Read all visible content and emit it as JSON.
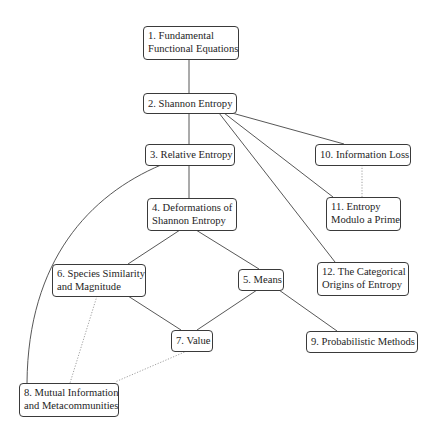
{
  "diagram": {
    "nodes": [
      {
        "id": "1",
        "lines": [
          "1. Fundamental",
          "Functional Equations"
        ]
      },
      {
        "id": "2",
        "lines": [
          "2. Shannon Entropy"
        ]
      },
      {
        "id": "3",
        "lines": [
          "3. Relative Entropy"
        ]
      },
      {
        "id": "4",
        "lines": [
          "4. Deformations of",
          "Shannon Entropy"
        ]
      },
      {
        "id": "5",
        "lines": [
          "5. Means"
        ]
      },
      {
        "id": "6",
        "lines": [
          "6. Species Similarity",
          "and Magnitude"
        ]
      },
      {
        "id": "7",
        "lines": [
          "7. Value"
        ]
      },
      {
        "id": "8",
        "lines": [
          "8. Mutual Information",
          "and Metacommunities"
        ]
      },
      {
        "id": "9",
        "lines": [
          "9. Probabilistic Methods"
        ]
      },
      {
        "id": "10",
        "lines": [
          "10. Information Loss"
        ]
      },
      {
        "id": "11",
        "lines": [
          "11. Entropy",
          "Modulo a Prime"
        ]
      },
      {
        "id": "12",
        "lines": [
          "12. The Categorical",
          "Origins of Entropy"
        ]
      }
    ],
    "edges": [
      {
        "from": "1",
        "to": "2",
        "style": "solid"
      },
      {
        "from": "2",
        "to": "3",
        "style": "solid"
      },
      {
        "from": "2",
        "to": "10",
        "style": "solid"
      },
      {
        "from": "2",
        "to": "11",
        "style": "solid"
      },
      {
        "from": "2",
        "to": "12",
        "style": "solid"
      },
      {
        "from": "3",
        "to": "4",
        "style": "solid"
      },
      {
        "from": "3",
        "to": "8",
        "style": "solid-curve"
      },
      {
        "from": "4",
        "to": "6",
        "style": "solid"
      },
      {
        "from": "4",
        "to": "5",
        "style": "solid"
      },
      {
        "from": "6",
        "to": "7",
        "style": "solid"
      },
      {
        "from": "5",
        "to": "7",
        "style": "solid"
      },
      {
        "from": "5",
        "to": "9",
        "style": "solid"
      },
      {
        "from": "10",
        "to": "11",
        "style": "dotted"
      },
      {
        "from": "6",
        "to": "8",
        "style": "dotted"
      },
      {
        "from": "7",
        "to": "8",
        "style": "dotted"
      }
    ]
  }
}
